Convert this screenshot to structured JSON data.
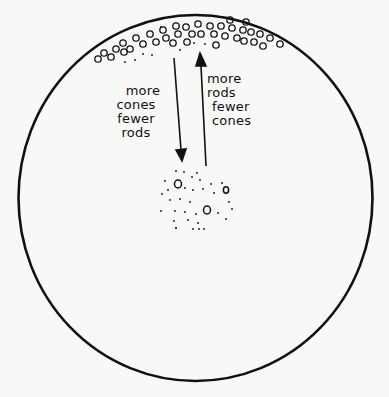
{
  "diagram": {
    "colors": {
      "ink": "#111111",
      "background": "#f8f8f6"
    },
    "labels": {
      "left": [
        "more",
        "cones",
        "fewer",
        "rods"
      ],
      "right": [
        "more",
        "rods",
        "fewer",
        "cones"
      ]
    },
    "arrows": [
      {
        "direction": "down",
        "from": "periphery",
        "to": "fovea",
        "label": "more cones fewer rods"
      },
      {
        "direction": "up",
        "from": "fovea",
        "to": "periphery",
        "label": "more rods fewer cones"
      }
    ],
    "regions": [
      {
        "name": "periphery",
        "description": "band of many cones (circles) near top edge"
      },
      {
        "name": "fovea",
        "description": "cluster of dots (rods) with few cones"
      }
    ]
  }
}
